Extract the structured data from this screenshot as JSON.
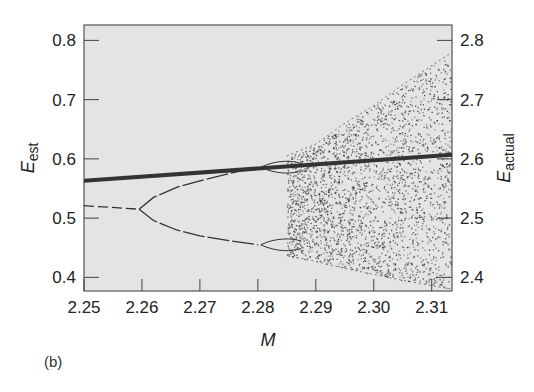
{
  "chart_data": {
    "type": "scatter",
    "title": "",
    "panel_label": "(b)",
    "xlabel": "M",
    "ylabel_left": {
      "main": "E",
      "sub": "est"
    },
    "ylabel_right": {
      "main": "E",
      "sub": "actual"
    },
    "xlim": [
      2.25,
      2.3135
    ],
    "ylim_left": [
      0.377,
      0.826
    ],
    "ylim_right": [
      2.377,
      2.826
    ],
    "x_ticks": [
      "2.25",
      "2.26",
      "2.27",
      "2.28",
      "2.29",
      "2.30",
      "2.31"
    ],
    "x_tick_values": [
      2.25,
      2.26,
      2.27,
      2.28,
      2.29,
      2.3,
      2.31
    ],
    "y_ticks_left": [
      "0.8",
      "0.7",
      "0.6",
      "0.5",
      "0.4"
    ],
    "y_tick_values_left": [
      0.8,
      0.7,
      0.6,
      0.5,
      0.4
    ],
    "y_ticks_right": [
      "2.8",
      "2.7",
      "2.6",
      "2.5",
      "2.4"
    ],
    "y_tick_values_right": [
      2.8,
      2.7,
      2.6,
      2.5,
      2.4
    ],
    "grid": false,
    "background": "#e4e4e4",
    "series": [
      {
        "name": "E_est (estimated)",
        "style": "thick-line",
        "color": "#333333",
        "x": [
          2.25,
          2.3135
        ],
        "y": [
          0.563,
          0.607
        ]
      },
      {
        "name": "period-1 branch",
        "style": "thin-dashed",
        "x": [
          2.25,
          2.2595
        ],
        "y": [
          0.521,
          0.515
        ]
      },
      {
        "name": "period-2 upper branch",
        "style": "thin-line",
        "x": [
          2.2595,
          2.262,
          2.266,
          2.27,
          2.275,
          2.28
        ],
        "y": [
          0.515,
          0.535,
          0.552,
          0.563,
          0.575,
          0.586
        ]
      },
      {
        "name": "period-2 lower branch",
        "style": "thin-line",
        "x": [
          2.2595,
          2.262,
          2.266,
          2.27,
          2.275,
          2.28
        ],
        "y": [
          0.515,
          0.496,
          0.48,
          0.47,
          0.462,
          0.455
        ]
      },
      {
        "name": "chaotic band envelope upper",
        "style": "scatter-region",
        "x": [
          2.285,
          2.29,
          2.295,
          2.3,
          2.305,
          2.3135
        ],
        "y": [
          0.605,
          0.625,
          0.66,
          0.69,
          0.725,
          0.78
        ]
      },
      {
        "name": "chaotic band envelope lower",
        "style": "scatter-region",
        "x": [
          2.285,
          2.29,
          2.295,
          2.3,
          2.305,
          2.3135
        ],
        "y": [
          0.437,
          0.427,
          0.415,
          0.405,
          0.395,
          0.38
        ]
      }
    ],
    "bifurcation_points": [
      {
        "M": 2.2595,
        "E": 0.515
      },
      {
        "M": 2.2805,
        "E": 0.586
      },
      {
        "M": 2.2805,
        "E": 0.455
      }
    ]
  }
}
